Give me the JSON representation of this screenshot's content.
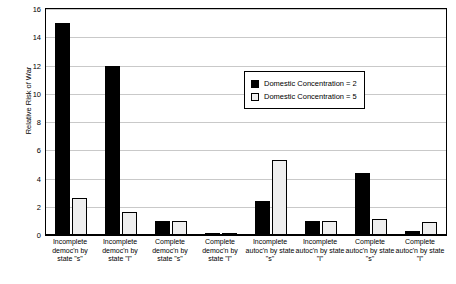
{
  "chart_data": {
    "type": "bar",
    "title": "",
    "xlabel": "",
    "ylabel": "Relative Risk of War",
    "ylim": [
      0,
      16
    ],
    "yticks": [
      0,
      2,
      4,
      6,
      8,
      10,
      12,
      14,
      16
    ],
    "grid": true,
    "legend_position": "inside-top-center",
    "categories": [
      "Incomplete democ'n by state \"s\"",
      "Incomplete democ'n by state \"l\"",
      "Complete democ'n by state \"s\"",
      "Complete democ'n by state \"l\"",
      "Incomplete autoc'n by state \"s\"",
      "Incomplete autoc'n by state \"l\"",
      "Complete autoc'n by state \"s\"",
      "Complete autoc'n by state \"l\""
    ],
    "series": [
      {
        "name": "Domestic Concentration = 2",
        "color": "#000000",
        "values": [
          15.0,
          12.0,
          1.0,
          0.15,
          2.4,
          1.0,
          4.4,
          0.3
        ]
      },
      {
        "name": "Domestic Concentration = 5",
        "color": "#efefef",
        "values": [
          2.6,
          1.6,
          1.0,
          0.15,
          5.3,
          1.0,
          1.1,
          0.9
        ]
      }
    ]
  },
  "legend": {
    "items": [
      {
        "label": "Domestic Concentration = 2"
      },
      {
        "label": "Domestic Concentration = 5"
      }
    ]
  }
}
